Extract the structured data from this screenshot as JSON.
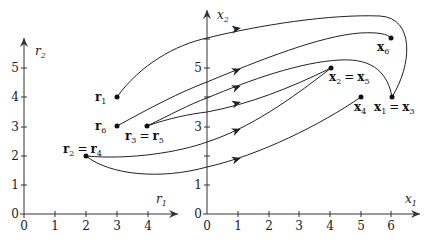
{
  "diagram": {
    "left_plot": {
      "x_axis_label": "r",
      "x_axis_sub": "1",
      "y_axis_label": "r",
      "y_axis_sub": "2",
      "x_ticks": [
        "0",
        "1",
        "2",
        "3",
        "4"
      ],
      "y_ticks": [
        "0",
        "1",
        "2",
        "3",
        "4",
        "5"
      ],
      "points": [
        {
          "id": "r1",
          "coords": [
            3,
            4
          ],
          "label": "r",
          "sub": "1"
        },
        {
          "id": "r6",
          "coords": [
            3,
            3
          ],
          "label": "r",
          "sub": "6"
        },
        {
          "id": "r3=r5",
          "coords": [
            4,
            3
          ],
          "label_a": "r",
          "sub_a": "3",
          "eq": "=",
          "label_b": "r",
          "sub_b": "5"
        },
        {
          "id": "r2=r4",
          "coords": [
            2,
            2
          ],
          "label_a": "r",
          "sub_a": "2",
          "eq": "=",
          "label_b": "r",
          "sub_b": "4"
        }
      ]
    },
    "right_plot": {
      "x_axis_label": "x",
      "x_axis_sub": "1",
      "y_axis_label": "x",
      "y_axis_sub": "2",
      "x_ticks": [
        "0",
        "1",
        "2",
        "3",
        "4",
        "5",
        "6"
      ],
      "y_tick_labels": [
        "0",
        "1",
        "3",
        "5"
      ],
      "y_tick_marks": [
        1,
        2,
        3,
        4,
        5,
        6
      ],
      "points": [
        {
          "id": "x6",
          "coords": [
            6,
            6
          ],
          "label": "x",
          "sub": "6"
        },
        {
          "id": "x2=x5",
          "coords": [
            4,
            5
          ],
          "label_a": "x",
          "sub_a": "2",
          "eq": "=",
          "label_b": "x",
          "sub_b": "5"
        },
        {
          "id": "x1=x3",
          "coords": [
            6,
            4
          ],
          "label_a": "x",
          "sub_a": "1",
          "eq": "=",
          "label_b": "x",
          "sub_b": "3"
        },
        {
          "id": "x4",
          "coords": [
            5,
            4
          ],
          "label": "x",
          "sub": "4"
        }
      ]
    },
    "mappings": [
      {
        "from": "r1",
        "to": "x1"
      },
      {
        "from": "r2",
        "to": "x2"
      },
      {
        "from": "r3",
        "to": "x3"
      },
      {
        "from": "r4",
        "to": "x4"
      },
      {
        "from": "r5",
        "to": "x5"
      },
      {
        "from": "r6",
        "to": "x6"
      }
    ]
  }
}
